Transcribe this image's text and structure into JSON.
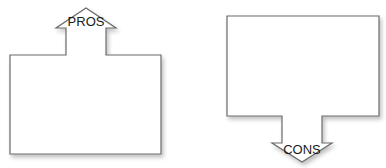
{
  "diagram": {
    "pros": {
      "label": "PROS",
      "direction": "up"
    },
    "cons": {
      "label": "CONS",
      "direction": "down"
    },
    "colors": {
      "stroke": "#6a6a6a",
      "fill": "#ffffff",
      "text": "#1a1a1a"
    }
  }
}
